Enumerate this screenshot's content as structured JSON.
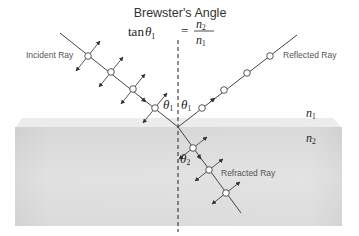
{
  "title": {
    "heading": "Brewster's Angle",
    "equation": {
      "lhs_func": "tan",
      "lhs_symbol": "θ",
      "lhs_sub": "1",
      "equals": "=",
      "numerator": "n",
      "numerator_sub": "2",
      "denominator": "n",
      "denominator_sub": "1"
    }
  },
  "labels": {
    "incident_ray": "Incident Ray",
    "reflected_ray": "Reflected Ray",
    "refracted_ray": "Refracted Ray",
    "medium_1": {
      "symbol": "n",
      "sub": "1"
    },
    "medium_2": {
      "symbol": "n",
      "sub": "2"
    },
    "angle_incident": {
      "symbol": "θ",
      "sub": "1"
    },
    "angle_reflected": {
      "symbol": "θ",
      "sub": "1"
    },
    "angle_refracted": {
      "symbol": "θ",
      "sub": "2"
    }
  },
  "colors": {
    "line": "#444444",
    "text": "#333333",
    "label_gray": "#555555",
    "slab_fill": "#dcdcdc",
    "slab_top": "#ececec",
    "circle_fill": "#ffffff"
  }
}
